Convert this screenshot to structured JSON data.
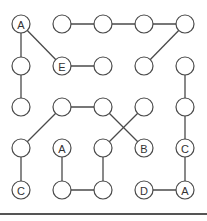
{
  "diagram": {
    "type": "grid-puzzle",
    "colors": {
      "stroke": "#4a4a4a",
      "fill": "#ffffff",
      "text": "#333333",
      "bottom_bar": "#555555"
    },
    "grid": {
      "cols": [
        21,
        62,
        103,
        144,
        185
      ],
      "rows": [
        24,
        66,
        107,
        148,
        190
      ],
      "radius": 9
    },
    "nodes": [
      {
        "id": "n00",
        "col": 0,
        "row": 0,
        "label": "A"
      },
      {
        "id": "n10",
        "col": 1,
        "row": 0,
        "label": ""
      },
      {
        "id": "n20",
        "col": 2,
        "row": 0,
        "label": ""
      },
      {
        "id": "n30",
        "col": 3,
        "row": 0,
        "label": ""
      },
      {
        "id": "n40",
        "col": 4,
        "row": 0,
        "label": ""
      },
      {
        "id": "n01",
        "col": 0,
        "row": 1,
        "label": ""
      },
      {
        "id": "n11",
        "col": 1,
        "row": 1,
        "label": "E"
      },
      {
        "id": "n21",
        "col": 2,
        "row": 1,
        "label": ""
      },
      {
        "id": "n31",
        "col": 3,
        "row": 1,
        "label": ""
      },
      {
        "id": "n41",
        "col": 4,
        "row": 1,
        "label": ""
      },
      {
        "id": "n02",
        "col": 0,
        "row": 2,
        "label": ""
      },
      {
        "id": "n12",
        "col": 1,
        "row": 2,
        "label": ""
      },
      {
        "id": "n22",
        "col": 2,
        "row": 2,
        "label": ""
      },
      {
        "id": "n32",
        "col": 3,
        "row": 2,
        "label": ""
      },
      {
        "id": "n42",
        "col": 4,
        "row": 2,
        "label": ""
      },
      {
        "id": "n03",
        "col": 0,
        "row": 3,
        "label": ""
      },
      {
        "id": "n13",
        "col": 1,
        "row": 3,
        "label": "A"
      },
      {
        "id": "n23",
        "col": 2,
        "row": 3,
        "label": ""
      },
      {
        "id": "n33",
        "col": 3,
        "row": 3,
        "label": "B"
      },
      {
        "id": "n43",
        "col": 4,
        "row": 3,
        "label": "C"
      },
      {
        "id": "n04",
        "col": 0,
        "row": 4,
        "label": "C"
      },
      {
        "id": "n14",
        "col": 1,
        "row": 4,
        "label": ""
      },
      {
        "id": "n24",
        "col": 2,
        "row": 4,
        "label": ""
      },
      {
        "id": "n34",
        "col": 3,
        "row": 4,
        "label": "D"
      },
      {
        "id": "n44",
        "col": 4,
        "row": 4,
        "label": "A"
      }
    ],
    "edges": [
      [
        "n00",
        "n01"
      ],
      [
        "n01",
        "n02"
      ],
      [
        "n00",
        "n11"
      ],
      [
        "n11",
        "n21"
      ],
      [
        "n10",
        "n20"
      ],
      [
        "n20",
        "n30"
      ],
      [
        "n30",
        "n40"
      ],
      [
        "n40",
        "n31"
      ],
      [
        "n41",
        "n42"
      ],
      [
        "n42",
        "n43"
      ],
      [
        "n43",
        "n44"
      ],
      [
        "n34",
        "n44"
      ],
      [
        "n12",
        "n22"
      ],
      [
        "n12",
        "n03"
      ],
      [
        "n03",
        "n04"
      ],
      [
        "n22",
        "n33"
      ],
      [
        "n32",
        "n23"
      ],
      [
        "n23",
        "n24"
      ],
      [
        "n13",
        "n14"
      ],
      [
        "n14",
        "n24"
      ]
    ]
  }
}
